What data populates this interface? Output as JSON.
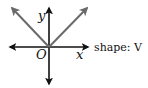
{
  "diagram": {
    "labels": {
      "y_axis": "y",
      "x_axis": "x",
      "origin": "O",
      "shape_caption": "shape: V"
    },
    "colors": {
      "axes": "#111111",
      "graph": "#6a6a6a",
      "background": "#ffffff"
    },
    "graph": {
      "description": "V-shaped graph with vertex at origin",
      "vertex": [
        0,
        0
      ],
      "arms": [
        "upper-left",
        "upper-right"
      ]
    }
  }
}
